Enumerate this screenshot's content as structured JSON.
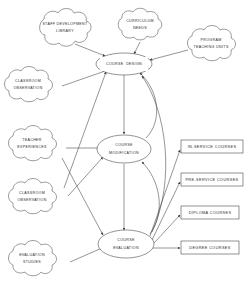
{
  "diagram": {
    "colors": {
      "stroke": "#3a3a3a",
      "edge": "#3f3f3f",
      "text": "#2b2b2b",
      "background": "#ffffff"
    },
    "process_nodes": [
      {
        "id": "course-design",
        "label_line1": "COURSE",
        "label_line2": "DESIGN"
      },
      {
        "id": "course-modification",
        "label_line1": "COURSE",
        "label_line2": "MODIFICATION"
      },
      {
        "id": "course-evaluation",
        "label_line1": "COURSE",
        "label_line2": "EVALUATION"
      }
    ],
    "input_clouds": [
      {
        "id": "staff-development-library",
        "label_line1": "STAFF DEVELOPMENT",
        "label_line2": "LIBRARY"
      },
      {
        "id": "curriculum-needs",
        "label_line1": "CURRICULUM",
        "label_line2": "NEEDS"
      },
      {
        "id": "program-teaching-units",
        "label_line1": "PROGRAM",
        "label_line2": "TEACHING UNITS"
      },
      {
        "id": "classroom-observation-top",
        "label_line1": "CLASSROOM",
        "label_line2": "OBSERVATION"
      },
      {
        "id": "teacher-experiences",
        "label_line1": "TEACHER",
        "label_line2": "EXPERIENCES"
      },
      {
        "id": "classroom-observation-mid",
        "label_line1": "CLASSROOM",
        "label_line2": "OBSERVATION"
      },
      {
        "id": "evaluation-studies",
        "label_line1": "EVALUATION",
        "label_line2": "STUDIES"
      }
    ],
    "output_boxes": [
      {
        "id": "in-service-courses",
        "label": "IN-SERVICE COURSES"
      },
      {
        "id": "pre-service-courses",
        "label": "PRE-SERVICE COURSES"
      },
      {
        "id": "diploma-courses",
        "label": "DIPLOMA COURSES"
      },
      {
        "id": "degree-courses",
        "label": "DEGREE COURSES"
      }
    ]
  }
}
